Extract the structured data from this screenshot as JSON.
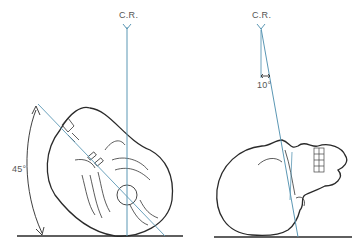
{
  "left_view": {
    "beam_label": "C.R.",
    "angle_label": "45°"
  },
  "right_view": {
    "beam_label": "C.R.",
    "angle_label": "10°"
  },
  "colors": {
    "line": "#2a2a2a",
    "beam": "#5b97b4",
    "text": "#555555"
  }
}
